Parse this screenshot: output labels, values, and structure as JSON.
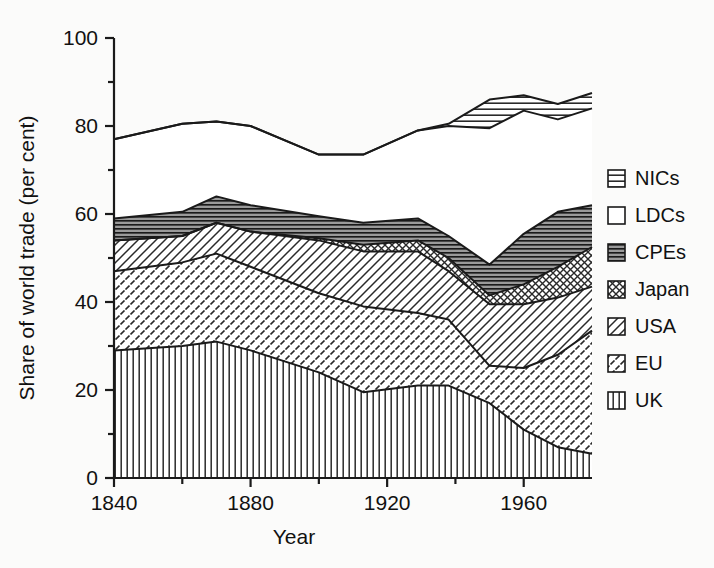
{
  "chart_data": {
    "type": "area",
    "stacked": true,
    "title": "",
    "subtitle": "",
    "xlabel": "Year",
    "ylabel": "Share of world trade (per cent)",
    "xlim": [
      1840,
      1980
    ],
    "ylim": [
      0,
      100
    ],
    "grid": false,
    "legend_position": "right",
    "x_major_ticks": [
      1840,
      1880,
      1920,
      1960
    ],
    "x_minor_ticks": [
      1860,
      1900,
      1940
    ],
    "y_major_ticks": [
      0,
      20,
      40,
      60,
      80,
      100
    ],
    "y_minor_ticks": [
      10,
      30,
      50,
      70,
      90
    ],
    "x_tick_labels": [
      "1840",
      "1880",
      "1920",
      "1960"
    ],
    "y_tick_labels": [
      "0",
      "20",
      "40",
      "60",
      "80",
      "100"
    ],
    "x": [
      1840,
      1860,
      1870,
      1880,
      1900,
      1913,
      1929,
      1938,
      1950,
      1960,
      1970,
      1980
    ],
    "series": [
      {
        "name": "UK",
        "pattern": "vertical-lines",
        "values": [
          29,
          30,
          31,
          29,
          24,
          19.5,
          21,
          21,
          17,
          11,
          7,
          5.5
        ]
      },
      {
        "name": "EU",
        "pattern": "dashed-diagonal",
        "values": [
          18,
          19,
          20,
          19,
          18,
          19.5,
          16.5,
          15,
          8.5,
          14,
          21,
          28
        ]
      },
      {
        "name": "USA",
        "pattern": "diagonal-hatch",
        "values": [
          7,
          6,
          7,
          8,
          12,
          12.5,
          14,
          11,
          14,
          14.5,
          13,
          10
        ]
      },
      {
        "name": "Japan",
        "pattern": "cross-hatch",
        "values": [
          0,
          0,
          0,
          0,
          0.5,
          1.5,
          2.5,
          3,
          2,
          4.5,
          7,
          9
        ]
      },
      {
        "name": "CPEs",
        "pattern": "horizontal-dark",
        "values": [
          5,
          5.5,
          6,
          6,
          5,
          5,
          5,
          5,
          7,
          11.5,
          12.5,
          9.5
        ]
      },
      {
        "name": "LDCs",
        "pattern": "blank",
        "values": [
          18,
          20,
          17,
          18,
          14,
          15.5,
          20,
          25,
          31,
          28,
          21,
          22
        ]
      },
      {
        "name": "NICs",
        "pattern": "horizontal-lines",
        "values": [
          0,
          0,
          0,
          0,
          0,
          0,
          0,
          0.5,
          6.5,
          3.5,
          3.5,
          3.5
        ]
      }
    ],
    "legend_entries": [
      {
        "label": "NICs",
        "pattern": "horizontal-lines"
      },
      {
        "label": "LDCs",
        "pattern": "blank"
      },
      {
        "label": "CPEs",
        "pattern": "horizontal-dark"
      },
      {
        "label": "Japan",
        "pattern": "cross-hatch"
      },
      {
        "label": "USA",
        "pattern": "diagonal-hatch"
      },
      {
        "label": "EU",
        "pattern": "dashed-diagonal"
      },
      {
        "label": "UK",
        "pattern": "vertical-lines"
      }
    ],
    "colors": {
      "ink": "#1a1a1a",
      "background": "#fbfbfa",
      "blank_fill": "#ffffff"
    }
  }
}
